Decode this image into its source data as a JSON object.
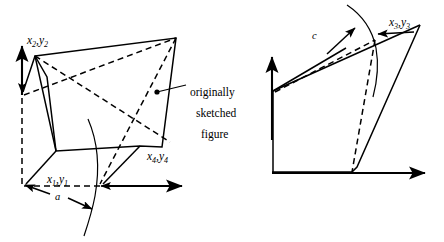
{
  "figure": {
    "background_color": "#ffffff",
    "line_color": "#000000",
    "panels": [
      {
        "id": "left",
        "name": "left-diagram",
        "labels": [
          {
            "id": "p2",
            "name": "label-x2-y2",
            "text": "x2,y2",
            "base": "x",
            "sub1": "2",
            "base2": "y",
            "sub2": "2",
            "x": 27,
            "y": 44
          },
          {
            "id": "p1",
            "name": "label-x1-y1",
            "text": "x1,y1",
            "base": "x",
            "sub1": "1",
            "base2": "y",
            "sub2": "1",
            "x": 47,
            "y": 183
          },
          {
            "id": "p4",
            "name": "label-x4-y4",
            "text": "x4,y4",
            "base": "x",
            "sub1": "4",
            "base2": "y",
            "sub2": "4",
            "x": 147,
            "y": 160
          },
          {
            "id": "a",
            "name": "label-a",
            "text": "a",
            "x": 55,
            "y": 200
          }
        ],
        "annotation": {
          "name": "originally-sketched-figure-callout",
          "lines": [
            "originally",
            "sketched",
            "figure"
          ],
          "x": 190,
          "y": 96,
          "line_height": 21
        }
      },
      {
        "id": "right",
        "name": "right-diagram",
        "labels": [
          {
            "id": "p3",
            "name": "label-x3-y3",
            "text": "x3,y3",
            "base": "x",
            "sub1": "3",
            "base2": "y",
            "sub2": "3",
            "x": 389,
            "y": 26
          },
          {
            "id": "c",
            "name": "label-c",
            "text": "c",
            "x": 312,
            "y": 39
          }
        ]
      }
    ],
    "axes": {
      "left": {
        "name": "left-axes",
        "origin_x": 22,
        "origin_y": 186,
        "x_end": 186,
        "y_end": 45
      },
      "right": {
        "name": "right-axes",
        "origin_x": 272,
        "origin_y": 173,
        "x_end": 430,
        "y_end": 56
      }
    }
  }
}
